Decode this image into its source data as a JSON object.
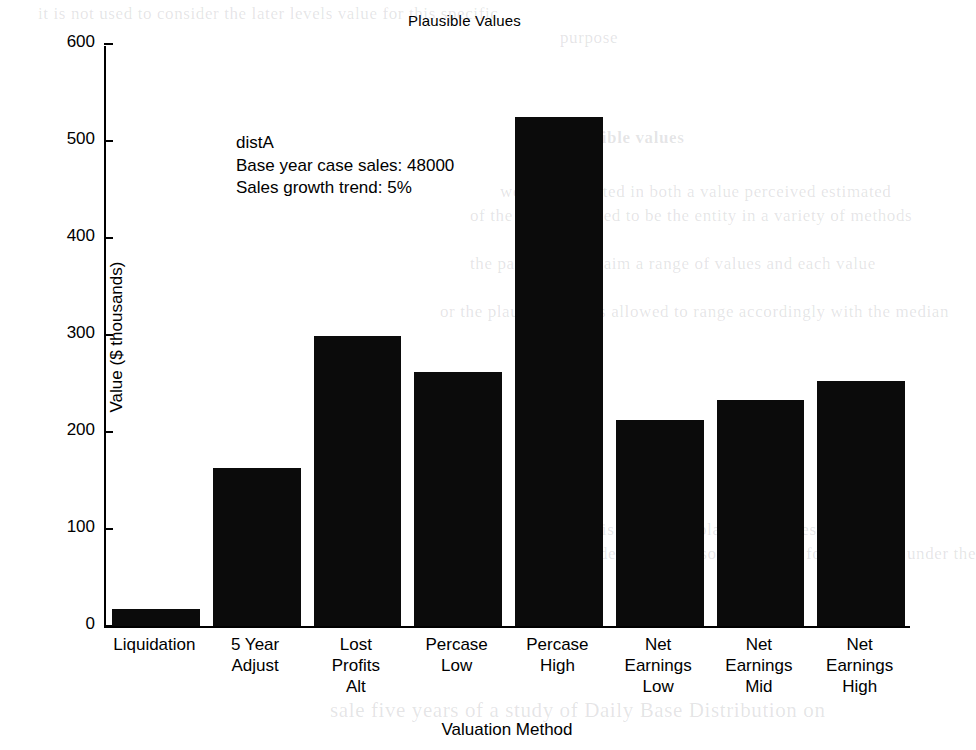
{
  "chart_data": {
    "type": "bar",
    "title": "Plausible Values",
    "xlabel": "Valuation Method",
    "ylabel": "Value ($ thousands)",
    "categories": [
      "Liquidation",
      "5 Year Adjust",
      "Lost Profits Alt",
      "Percase Low",
      "Percase High",
      "Net Earnings Low",
      "Net Earnings Mid",
      "Net Earnings High"
    ],
    "category_lines": [
      [
        "Liquidation"
      ],
      [
        "5 Year",
        "Adjust"
      ],
      [
        "Lost",
        "Profits",
        "Alt"
      ],
      [
        "Percase",
        "Low"
      ],
      [
        "Percase",
        "High"
      ],
      [
        "Net",
        "Earnings",
        "Low"
      ],
      [
        "Net",
        "Earnings",
        "Mid"
      ],
      [
        "Net",
        "Earnings",
        "High"
      ]
    ],
    "values": [
      18,
      163,
      299,
      262,
      525,
      212,
      233,
      253
    ],
    "ylim": [
      0,
      600
    ],
    "yticks": [
      0,
      100,
      200,
      300,
      400,
      500,
      600
    ],
    "ytick_labels": [
      "0",
      "100",
      "200",
      "300",
      "400",
      "500",
      "600"
    ],
    "grid": false,
    "legend": "none",
    "bar_color": "#0b0b0b"
  },
  "annotation": {
    "line1": "distA",
    "line2": "Base year case sales: 48000",
    "line3": "Sales growth trend: 5%"
  },
  "background_text": {
    "b1": "it is not used to consider the later levels value for this specific",
    "b2": "purpose",
    "b3": "plausible values",
    "b4": "we are interested in both a value perceived estimated",
    "b5": "of the parties agreed to be the entity in a variety of methods",
    "b6": "the parties each claim a range of values and each value",
    "b7": "or the plausible values allowed to range accordingly with the median",
    "b8": "there is a range of plausible values that can be",
    "b9": "considered as a reasonable value for the entity under the",
    "b10": "sale five years of a study of Daily Base Distribution on"
  }
}
